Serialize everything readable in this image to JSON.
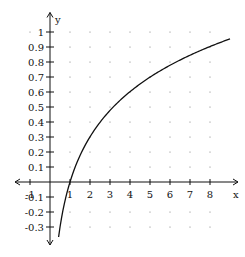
{
  "chart_data": {
    "type": "line",
    "title": "",
    "function": "y = log10(x)",
    "xlabel": "x",
    "ylabel": "y",
    "xlim": [
      -1.75,
      9.4
    ],
    "ylim": [
      -0.42,
      1.13
    ],
    "grid": "dots",
    "x_ticks": [
      -1,
      1,
      2,
      3,
      4,
      5,
      6,
      7,
      8
    ],
    "x_tick_labels": [
      "-1",
      "1",
      "2",
      "3",
      "4",
      "5",
      "6",
      "7",
      "8"
    ],
    "y_ticks": [
      1,
      0.9,
      0.8,
      0.7,
      0.6,
      0.5,
      0.4,
      0.3,
      0.2,
      0.1,
      -0.1,
      -0.2,
      -0.3
    ],
    "y_tick_labels": [
      "1",
      "0.9",
      "0.8",
      "0.7",
      "0.6",
      "0.5",
      "0.4",
      "0.3",
      "0.2",
      "0.1",
      "-0.1",
      "-0.2",
      "-0.3"
    ],
    "series": [
      {
        "name": "log10(x)",
        "x": [
          0.43,
          0.5,
          0.6,
          0.7,
          0.8,
          0.9,
          1,
          1.25,
          1.5,
          2,
          2.5,
          3,
          3.5,
          4,
          4.5,
          5,
          5.5,
          6,
          6.5,
          7,
          7.5,
          8,
          8.5,
          9
        ],
        "y": [
          -0.367,
          -0.301,
          -0.222,
          -0.155,
          -0.097,
          -0.046,
          0,
          0.097,
          0.176,
          0.301,
          0.398,
          0.477,
          0.544,
          0.602,
          0.653,
          0.699,
          0.74,
          0.778,
          0.813,
          0.845,
          0.875,
          0.903,
          0.929,
          0.954
        ]
      }
    ],
    "dot_grid": {
      "x": [
        1,
        2,
        3,
        4,
        5,
        6,
        7,
        8
      ],
      "y": [
        1,
        0.9,
        0.8,
        0.7,
        0.6,
        0.5,
        0.4,
        0.3,
        0.2,
        0.1,
        -0.1,
        -0.2,
        -0.3
      ],
      "extra_points": [
        [
          -1,
          1
        ]
      ]
    },
    "colors": {
      "curve": "#111111",
      "axis": "#111111",
      "dots": "#777777",
      "background": "#ffffff"
    }
  }
}
